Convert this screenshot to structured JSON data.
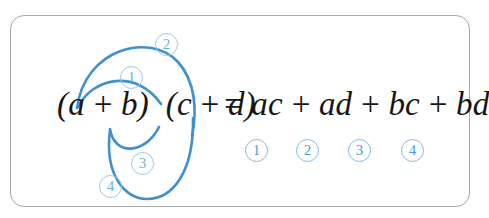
{
  "figure": {
    "kind": "foil-distributive-law-diagram",
    "border_color": "#a9a9a9",
    "arc_color": "#3f90cd",
    "label_color": "#5ca6d6",
    "text_color": "#161616"
  },
  "equation": {
    "left_side": "(a + b) (c + d)",
    "equals": "=",
    "right_side": "ac + ad + bc + bd",
    "lhs_text": "(a + b)  (c + d)",
    "rhs_text": "= ac + ad + bc + bd",
    "terms": [
      {
        "id": 1,
        "text": "ac",
        "from": "a",
        "to": "c"
      },
      {
        "id": 2,
        "text": "ad",
        "from": "a",
        "to": "d"
      },
      {
        "id": 3,
        "text": "bc",
        "from": "b",
        "to": "c"
      },
      {
        "id": 4,
        "text": "bd",
        "from": "b",
        "to": "d"
      }
    ]
  },
  "arc_labels": [
    {
      "id": 1,
      "label": "①",
      "number": "1",
      "x": 120,
      "y": 66
    },
    {
      "id": 2,
      "label": "②",
      "number": "2",
      "x": 155,
      "y": 33
    },
    {
      "id": 3,
      "label": "③",
      "number": "3",
      "x": 131,
      "y": 152
    },
    {
      "id": 4,
      "label": "④",
      "number": "4",
      "x": 99,
      "y": 175
    }
  ],
  "term_labels": [
    {
      "id": 1,
      "number": "1",
      "x": 245,
      "y": 139
    },
    {
      "id": 2,
      "number": "2",
      "x": 296,
      "y": 139
    },
    {
      "id": 3,
      "number": "3",
      "x": 348,
      "y": 139
    },
    {
      "id": 4,
      "number": "4",
      "x": 401,
      "y": 139
    }
  ],
  "arcs": [
    {
      "id": 1,
      "name": "arc-a-to-c",
      "path": "M 78 107 C 92 78, 136 68, 161 104"
    },
    {
      "id": 2,
      "name": "arc-a-to-d",
      "path": "M 77 108 C 85 48, 150 32, 178 62 C 196 82, 197 112, 192 136"
    },
    {
      "id": 3,
      "name": "arc-b-to-c",
      "path": "M 110 129 C 114 156, 145 155, 159 127"
    },
    {
      "id": 4,
      "name": "arc-b-to-d",
      "path": "M 110 130 C 104 176, 126 199, 147 199 C 174 199, 194 170, 193 118"
    }
  ]
}
